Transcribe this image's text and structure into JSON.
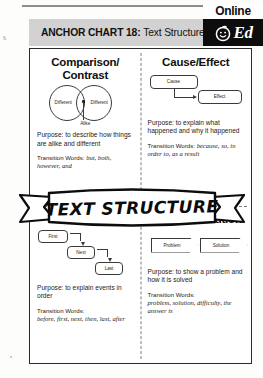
{
  "page": {
    "margin_glyph": "s"
  },
  "header": {
    "label": "ANCHOR CHART 18:",
    "title": "Text Structure"
  },
  "logo": {
    "online_label": "Online",
    "ed_label": "Ed",
    "face_icon": "smiley-face-icon"
  },
  "banner": {
    "title": "TEXT STRUCTURE"
  },
  "quadrants": [
    {
      "id": "comparison-contrast",
      "title": "Comparison/ Contrast",
      "title_line1": "Comparison/",
      "title_line2": "Contrast",
      "diagram": {
        "type": "venn",
        "left_label": "Different",
        "right_label": "Different",
        "center_label": "Alike"
      },
      "purpose_label": "Purpose:",
      "purpose_text": "to describe how things are alike and different",
      "transition_label": "Transition Words:",
      "transition_words": "but, both, however, and"
    },
    {
      "id": "cause-effect",
      "title": "Cause/Effect",
      "diagram": {
        "type": "flow-boxes",
        "node1": "Cause",
        "node2": "Effect"
      },
      "purpose_label": "Purpose:",
      "purpose_text": "to explain what happened and why it happened",
      "transition_label": "Transition Words:",
      "transition_words": "because, so, in order to, as a result"
    },
    {
      "id": "sequence",
      "title": "Sequence",
      "diagram": {
        "type": "step-boxes",
        "node1": "First",
        "node2": "Next",
        "node3": "Last"
      },
      "purpose_label": "Purpose:",
      "purpose_text": "to explain events in order",
      "transition_label": "Transition Words:",
      "transition_words": "before, first, next, then, last, after"
    },
    {
      "id": "problem-solution",
      "title": "Problem/Solution",
      "diagram": {
        "type": "chevrons",
        "node1": "Problem",
        "node2": "Solution"
      },
      "purpose_label": "Purpose:",
      "purpose_text": "to show a problem and how it is solved",
      "transition_label": "Transition Words:",
      "transition_words": "problem, solution, difficulty, the answer is"
    }
  ],
  "colors": {
    "header_bar": "#d2d2d2",
    "logo_box": "#0d0d0d",
    "frame_border": "#2b2b2b",
    "ink": "#101010"
  }
}
